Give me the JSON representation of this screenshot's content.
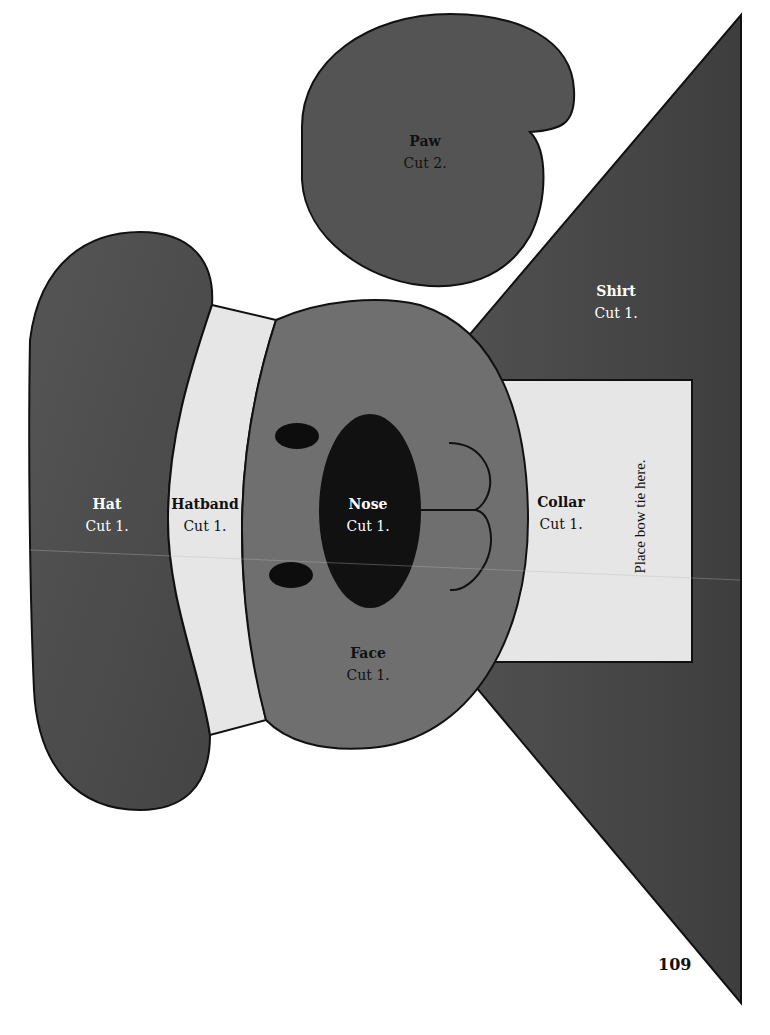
{
  "colors": {
    "dark_gray": "#4a4a4a",
    "mid_gray": "#6e6e6e",
    "light_gray": "#e4e4e4",
    "black": "#111111"
  },
  "pieces": {
    "paw": {
      "title": "Paw",
      "cut": "Cut 2."
    },
    "shirt": {
      "title": "Shirt",
      "cut": "Cut 1."
    },
    "hat": {
      "title": "Hat",
      "cut": "Cut 1."
    },
    "hatband": {
      "title": "Hatband",
      "cut": "Cut 1."
    },
    "nose": {
      "title": "Nose",
      "cut": "Cut 1."
    },
    "face": {
      "title": "Face",
      "cut": "Cut 1."
    },
    "collar": {
      "title": "Collar",
      "cut": "Cut 1.",
      "note": "Place bow tie here."
    }
  },
  "page_number": "109"
}
